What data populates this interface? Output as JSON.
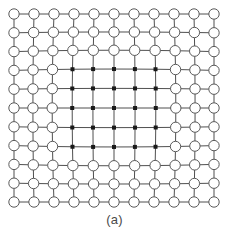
{
  "figure": {
    "caption": "(a)",
    "title": "",
    "kind": "deformable-mesh-grid"
  },
  "chart_data": {
    "type": "scatter",
    "title": "",
    "subtitle": "",
    "xlabel": "",
    "ylabel": "",
    "annotations": [
      "(a)"
    ],
    "legend": [],
    "legend_position": "none",
    "grid": true,
    "xlim": [
      0,
      10
    ],
    "ylim": [
      0,
      10
    ],
    "grid_rows": 11,
    "grid_cols": 11,
    "inner_block": {
      "row_start": 3,
      "row_end": 7,
      "col_start": 3,
      "col_end": 7,
      "rows": 5,
      "cols": 5,
      "marker": "filled-square",
      "marker_color": "#1a1a1a",
      "marker_size": 4
    },
    "outer_marker": {
      "marker": "open-circle",
      "marker_color": "#5a5a5a",
      "fill": "#ffffff",
      "radius": 5.2
    },
    "line_color": "#4f4f4f",
    "line_width": 1,
    "bounds": {
      "left": 14,
      "top": 14,
      "right": 214,
      "bottom": 202
    },
    "spacing": {
      "x": 20.0,
      "y": 18.8
    },
    "deformation": {
      "model": "pincushion",
      "amplitude_x": 5.2,
      "amplitude_y": 4.6,
      "inner_pull": 0.55
    },
    "series": [
      {
        "name": "outer control points",
        "marker": "open-circle",
        "count": 96
      },
      {
        "name": "inner deformed points",
        "marker": "filled-square",
        "count": 25
      }
    ],
    "x": [
      0,
      1,
      2,
      3,
      4,
      5,
      6,
      7,
      8,
      9,
      10
    ],
    "y": [
      0,
      1,
      2,
      3,
      4,
      5,
      6,
      7,
      8,
      9,
      10
    ],
    "values": [
      [
        0,
        1,
        2,
        3,
        4,
        5,
        6,
        7,
        8,
        9,
        10
      ],
      [
        0,
        1,
        2,
        3,
        4,
        5,
        6,
        7,
        8,
        9,
        10
      ],
      [
        0,
        1,
        2,
        3,
        4,
        5,
        6,
        7,
        8,
        9,
        10
      ],
      [
        0,
        1,
        2,
        3,
        4,
        5,
        6,
        7,
        8,
        9,
        10
      ],
      [
        0,
        1,
        2,
        3,
        4,
        5,
        6,
        7,
        8,
        9,
        10
      ],
      [
        0,
        1,
        2,
        3,
        4,
        5,
        6,
        7,
        8,
        9,
        10
      ],
      [
        0,
        1,
        2,
        3,
        4,
        5,
        6,
        7,
        8,
        9,
        10
      ],
      [
        0,
        1,
        2,
        3,
        4,
        5,
        6,
        7,
        8,
        9,
        10
      ],
      [
        0,
        1,
        2,
        3,
        4,
        5,
        6,
        7,
        8,
        9,
        10
      ],
      [
        0,
        1,
        2,
        3,
        4,
        5,
        6,
        7,
        8,
        9,
        10
      ],
      [
        0,
        1,
        2,
        3,
        4,
        5,
        6,
        7,
        8,
        9,
        10
      ]
    ]
  }
}
